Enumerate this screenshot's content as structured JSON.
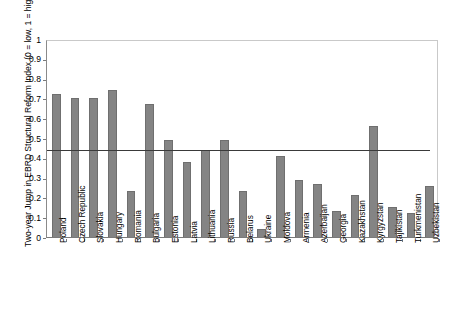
{
  "chart_data": {
    "type": "bar",
    "title": "",
    "xlabel": "",
    "ylabel": "Two-year Jump in EBRD Structural Reform Index (0 = low, 1 = high)",
    "ylim": [
      0,
      1
    ],
    "ytick_labels": [
      "0",
      "0.1",
      "0.2",
      "0.3",
      "0.4",
      "0.5",
      "0.6",
      "0.7",
      "0.8",
      "0.9",
      "1"
    ],
    "ytick_values": [
      0,
      0.1,
      0.2,
      0.3,
      0.4,
      0.5,
      0.6,
      0.7,
      0.8,
      0.9,
      1
    ],
    "grid": false,
    "legend": "none",
    "bar_color": "#848484",
    "bar_edge_color": "#6f6f6f",
    "reference_line": {
      "name": "average-reference-line",
      "value": 0.45,
      "color": "#3a3a3a"
    },
    "categories": [
      "Poland",
      "Czech Republic",
      "Slovakia",
      "Hungary",
      "Romania",
      "Bulgaria",
      "Estonia",
      "Latvia",
      "Lithuania",
      "Russia",
      "Belarus",
      "Ukraine",
      "Moldova",
      "Armenia",
      "Azerbaijan",
      "Georgia",
      "Kazakhstan",
      "Kyrgyzstan",
      "Tajikistan",
      "Turkmenistan",
      "Uzbekistan"
    ],
    "values": [
      0.72,
      0.7,
      0.7,
      0.74,
      0.23,
      0.67,
      0.49,
      0.38,
      0.44,
      0.49,
      0.23,
      0.04,
      0.41,
      0.29,
      0.27,
      0.13,
      0.21,
      0.56,
      0.15,
      0.12,
      0.26
    ]
  }
}
